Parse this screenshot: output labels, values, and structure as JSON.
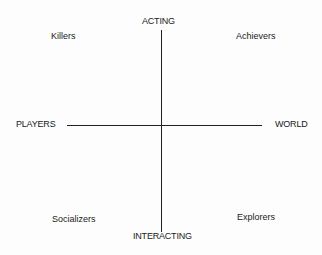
{
  "diagram": {
    "axes": {
      "top": "ACTING",
      "bottom": "INTERACTING",
      "left": "PLAYERS",
      "right": "WORLD"
    },
    "quadrants": {
      "top_left": "Killers",
      "top_right": "Achievers",
      "bottom_left": "Socializers",
      "bottom_right": "Explorers"
    }
  }
}
